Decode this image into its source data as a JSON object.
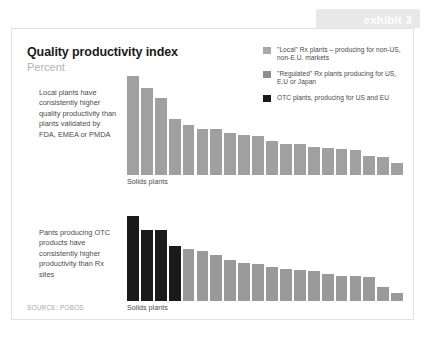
{
  "exhibit": {
    "label": "exhibit 3"
  },
  "header": {
    "title": "Quality productivity index",
    "subtitle": "Percent"
  },
  "legend": {
    "items": [
      {
        "label": "\"Local\" Rx plants – producing for non-US, non-E.U. markets",
        "color": "#a9a9a9",
        "icon": "legend-swatch-local"
      },
      {
        "label": "\"Regulated\" Rx plants producing for US, E.U or Japan",
        "color": "#8e8e8e",
        "icon": "legend-swatch-regulated"
      },
      {
        "label": "OTC plants, producing for US and EU",
        "color": "#1a1a1a",
        "icon": "legend-swatch-otc"
      }
    ]
  },
  "annotations": {
    "first": "Local plants have consistently higher quality productivity than plants validated by FDA, EMEA or PMDA",
    "second": "Pants producing OTC products have consistently higher productivity than Rx sites"
  },
  "source": "SOURCE: POBOS",
  "chart_data": [
    {
      "id": "chart-1",
      "type": "bar",
      "title": "Quality productivity index",
      "subtitle": "Percent",
      "xlabel": "Solids plants",
      "ylabel": "",
      "grid": false,
      "legend_position": "top-right",
      "ylim": [
        0,
        100
      ],
      "categories": [
        "1",
        "2",
        "3",
        "4",
        "5",
        "6",
        "7",
        "8",
        "9",
        "10",
        "11",
        "12",
        "13",
        "14",
        "15",
        "16",
        "17",
        "18",
        "19",
        "20"
      ],
      "values": [
        100,
        88,
        78,
        57,
        51,
        46,
        46,
        42,
        40,
        39,
        34,
        31,
        31,
        28,
        27,
        26,
        25,
        19,
        18,
        12
      ],
      "colors": [
        "#a0a0a0",
        "#a0a0a0",
        "#a0a0a0",
        "#a0a0a0",
        "#a0a0a0",
        "#a0a0a0",
        "#a0a0a0",
        "#a0a0a0",
        "#a0a0a0",
        "#a0a0a0",
        "#a0a0a0",
        "#a0a0a0",
        "#a0a0a0",
        "#a0a0a0",
        "#a0a0a0",
        "#a0a0a0",
        "#a0a0a0",
        "#a0a0a0",
        "#a0a0a0",
        "#a0a0a0"
      ]
    },
    {
      "id": "chart-2",
      "type": "bar",
      "title": "Quality productivity index",
      "subtitle": "Percent",
      "xlabel": "Solids plants",
      "ylabel": "",
      "grid": false,
      "legend_position": "top-right",
      "ylim": [
        0,
        100
      ],
      "categories": [
        "1",
        "2",
        "3",
        "4",
        "5",
        "6",
        "7",
        "8",
        "9",
        "10",
        "11",
        "12",
        "13",
        "14",
        "15",
        "16",
        "17",
        "18",
        "19",
        "20"
      ],
      "values": [
        100,
        83,
        83,
        65,
        61,
        59,
        54,
        48,
        45,
        44,
        40,
        38,
        36,
        35,
        32,
        30,
        29,
        28,
        17,
        10
      ],
      "colors": [
        "#1a1a1a",
        "#1a1a1a",
        "#1a1a1a",
        "#1a1a1a",
        "#9a9a9a",
        "#9a9a9a",
        "#9a9a9a",
        "#9a9a9a",
        "#9a9a9a",
        "#9a9a9a",
        "#9a9a9a",
        "#9a9a9a",
        "#9a9a9a",
        "#9a9a9a",
        "#9a9a9a",
        "#9a9a9a",
        "#9a9a9a",
        "#9a9a9a",
        "#9a9a9a",
        "#9a9a9a"
      ]
    }
  ]
}
